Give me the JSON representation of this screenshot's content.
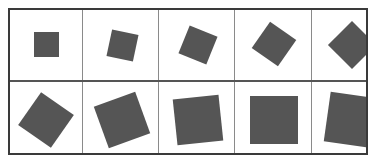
{
  "figure": {
    "square_color": "#555555",
    "border_color": "#3a3a3a",
    "grid_line_color": "#8a8a8a",
    "rows": 2,
    "columns": 5,
    "cells": [
      {
        "row": 0,
        "col": 0,
        "cx": 36,
        "cy": 34,
        "size": 25,
        "rotation": 0
      },
      {
        "row": 0,
        "col": 1,
        "cx": 112,
        "cy": 35,
        "size": 27,
        "rotation": 12
      },
      {
        "row": 0,
        "col": 2,
        "cx": 188,
        "cy": 35,
        "size": 30,
        "rotation": 22
      },
      {
        "row": 0,
        "col": 3,
        "cx": 264,
        "cy": 34,
        "size": 32,
        "rotation": 35
      },
      {
        "row": 0,
        "col": 4,
        "cx": 342,
        "cy": 35,
        "size": 34,
        "rotation": 45
      },
      {
        "row": 1,
        "col": 0,
        "cx": 36,
        "cy": 110,
        "size": 40,
        "rotation": -55
      },
      {
        "row": 1,
        "col": 1,
        "cx": 112,
        "cy": 110,
        "size": 44,
        "rotation": -20
      },
      {
        "row": 1,
        "col": 2,
        "cx": 188,
        "cy": 110,
        "size": 46,
        "rotation": -6
      },
      {
        "row": 1,
        "col": 3,
        "cx": 264,
        "cy": 110,
        "size": 48,
        "rotation": 0
      },
      {
        "row": 1,
        "col": 4,
        "cx": 342,
        "cy": 110,
        "size": 50,
        "rotation": 8
      }
    ]
  }
}
